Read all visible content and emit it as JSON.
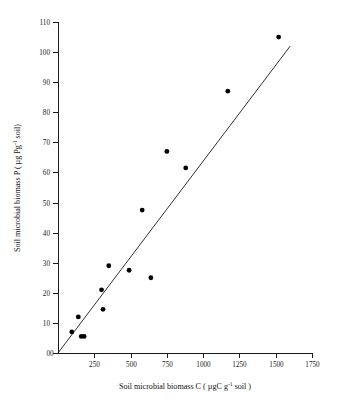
{
  "chart_data": {
    "type": "scatter",
    "title": "",
    "xlabel": "Soil microbial biomass C ( µgC g-1 soil )",
    "xlabel_parts": {
      "pre": "Soil microbial biomass C ( µgC g",
      "sup": "-1",
      "post": " soil )"
    },
    "ylabel": "Soil microbial biomass P ( µg Pg-1 soil)",
    "ylabel_parts": {
      "pre": "Soil microbial biomass P ( µg Pg",
      "sup": "-1",
      "post": " soil)"
    },
    "xlim": [
      0,
      1750
    ],
    "ylim": [
      0,
      110
    ],
    "xticks": [
      0,
      250,
      500,
      750,
      1000,
      1250,
      1500,
      1750
    ],
    "xtick_labels": [
      "0",
      "250",
      "500",
      "750",
      "1000",
      "1250",
      "1500",
      "1750"
    ],
    "yticks": [
      0,
      10,
      20,
      30,
      40,
      50,
      60,
      70,
      80,
      90,
      100,
      110
    ],
    "ytick_labels": [
      "0",
      "10",
      "20",
      "30",
      "40",
      "50",
      "60",
      "70",
      "80",
      "90",
      "100",
      "110"
    ],
    "grid": false,
    "legend": null,
    "marker": "filled-circle",
    "marker_color": "#000000",
    "x": [
      95,
      140,
      160,
      180,
      300,
      310,
      350,
      490,
      580,
      640,
      750,
      880,
      1170,
      1520
    ],
    "y": [
      7,
      12,
      5.5,
      5.5,
      21,
      14.5,
      29,
      27.5,
      47.5,
      25,
      67,
      61.5,
      87,
      105
    ],
    "points": [
      {
        "x": 95,
        "y": 7
      },
      {
        "x": 140,
        "y": 12
      },
      {
        "x": 160,
        "y": 5.5
      },
      {
        "x": 180,
        "y": 5.5
      },
      {
        "x": 300,
        "y": 21
      },
      {
        "x": 310,
        "y": 14.5
      },
      {
        "x": 350,
        "y": 29
      },
      {
        "x": 490,
        "y": 27.5
      },
      {
        "x": 580,
        "y": 47.5
      },
      {
        "x": 640,
        "y": 25
      },
      {
        "x": 750,
        "y": 67
      },
      {
        "x": 880,
        "y": 61.5
      },
      {
        "x": 1170,
        "y": 87
      },
      {
        "x": 1520,
        "y": 105
      }
    ],
    "trendline": {
      "type": "linear",
      "from": {
        "x": 0,
        "y": 0
      },
      "to": {
        "x": 1600,
        "y": 102
      },
      "slope": 0.0638,
      "intercept": 0
    }
  }
}
